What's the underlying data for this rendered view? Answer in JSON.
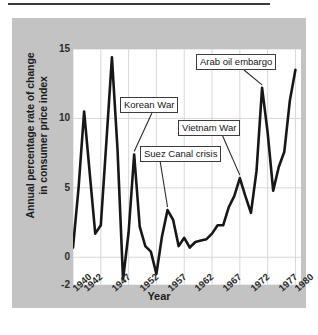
{
  "figure": {
    "background_color": "#c3c3c3",
    "plot_background_color": "#ffffff",
    "line_color": "#171717",
    "grid_color": "#d8d8d8"
  },
  "chart_data": {
    "type": "line",
    "title": "",
    "xlabel": "Year",
    "ylabel": "Annual percentage rate of change in consumer price index",
    "ylabel_line1": "Annual percentage rate of change",
    "ylabel_line2": "in consumer price index",
    "xlim": [
      1940,
      1981
    ],
    "ylim": [
      -2,
      15
    ],
    "yticks": [
      -2,
      0,
      5,
      10,
      15
    ],
    "ytick_labels": [
      "-2",
      "0",
      "5",
      "10",
      "15"
    ],
    "xticks": [
      1940,
      1942,
      1947,
      1952,
      1957,
      1962,
      1967,
      1972,
      1977,
      1980
    ],
    "xtick_labels": [
      "1940",
      "1942",
      "1947",
      "1952",
      "1957",
      "1962",
      "1967",
      "1972",
      "1977",
      "1980"
    ],
    "grid": true,
    "legend": "none",
    "x": [
      1940,
      1941,
      1942,
      1943,
      1944,
      1945,
      1946,
      1947,
      1948,
      1949,
      1950,
      1951,
      1952,
      1953,
      1954,
      1955,
      1956,
      1957,
      1958,
      1959,
      1960,
      1961,
      1962,
      1963,
      1964,
      1965,
      1966,
      1967,
      1968,
      1969,
      1970,
      1971,
      1972,
      1973,
      1974,
      1975,
      1976,
      1977,
      1978,
      1979,
      1980
    ],
    "values": [
      0.7,
      5.0,
      10.5,
      6.1,
      1.7,
      2.3,
      8.3,
      14.4,
      7.8,
      -1.6,
      1.8,
      7.4,
      2.2,
      0.8,
      0.4,
      -1.2,
      1.5,
      3.4,
      2.7,
      0.8,
      1.4,
      0.7,
      1.1,
      1.2,
      1.3,
      1.7,
      2.3,
      2.3,
      3.6,
      4.4,
      5.7,
      4.4,
      3.2,
      6.2,
      12.2,
      9.0,
      4.8,
      6.5,
      7.6,
      11.3,
      13.5
    ],
    "annotations": [
      {
        "id": "korean-war",
        "label": "Korean War",
        "year": 1951,
        "value": 7.4
      },
      {
        "id": "suez-canal-crisis",
        "label": "Suez Canal crisis",
        "year": 1957,
        "value": 3.4
      },
      {
        "id": "vietnam-war",
        "label": "Vietnam War",
        "year": 1970,
        "value": 5.7
      },
      {
        "id": "arab-oil-embargo",
        "label": "Arab oil embargo",
        "year": 1974,
        "value": 12.2
      }
    ]
  }
}
